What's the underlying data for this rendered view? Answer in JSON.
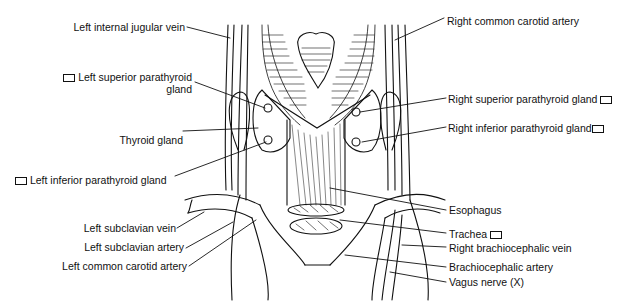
{
  "diagram": {
    "labels_left": [
      {
        "id": "left-internal-jugular-vein",
        "text": "Left internal jugular vein",
        "box": false
      },
      {
        "id": "left-superior-parathyroid-gland",
        "text": "Left superior parathyroid",
        "text2": "gland",
        "box": true
      },
      {
        "id": "thyroid-gland",
        "text": "Thyroid gland",
        "box": false
      },
      {
        "id": "left-inferior-parathyroid-gland",
        "text": "Left inferior parathyroid gland",
        "box": true
      },
      {
        "id": "left-subclavian-vein",
        "text": "Left subclavian vein",
        "box": false
      },
      {
        "id": "left-subclavian-artery",
        "text": "Left subclavian artery",
        "box": false
      },
      {
        "id": "left-common-carotid-artery",
        "text": "Left common carotid artery",
        "box": false
      }
    ],
    "labels_right": [
      {
        "id": "right-common-carotid-artery",
        "text": "Right common carotid artery",
        "box": false
      },
      {
        "id": "right-superior-parathyroid-gland",
        "text": "Right superior parathyroid gland",
        "box": true
      },
      {
        "id": "right-inferior-parathyroid-gland",
        "text": "Right inferior parathyroid gland",
        "box": true
      },
      {
        "id": "esophagus",
        "text": "Esophagus",
        "box": false
      },
      {
        "id": "trachea",
        "text": "Trachea",
        "box": true
      },
      {
        "id": "right-brachiocephalic-vein",
        "text": "Right brachiocephalic vein",
        "box": false
      },
      {
        "id": "brachiocephalic-artery",
        "text": "Brachiocephalic artery",
        "box": false
      },
      {
        "id": "vagus-nerve",
        "text": "Vagus nerve (X)",
        "box": false
      }
    ]
  }
}
